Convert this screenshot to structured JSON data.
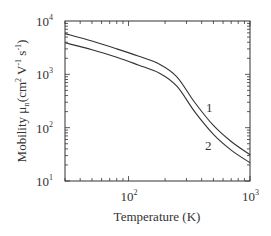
{
  "chart_data": {
    "type": "line",
    "title": "",
    "xlabel": "Temperature (K)",
    "ylabel": "Mobility μn(cm² V⁻¹ s⁻¹)",
    "xscale": "log",
    "yscale": "log",
    "xlim": [
      30,
      1000
    ],
    "ylim": [
      10,
      10000
    ],
    "grid": false,
    "legend_position": "inline labels near curves",
    "x_ticks": [
      {
        "base": "10",
        "exp": "2",
        "value": 100
      },
      {
        "base": "10",
        "exp": "3",
        "value": 1000
      }
    ],
    "y_ticks": [
      {
        "base": "10",
        "exp": "1",
        "value": 10
      },
      {
        "base": "10",
        "exp": "2",
        "value": 100
      },
      {
        "base": "10",
        "exp": "3",
        "value": 1000
      },
      {
        "base": "10",
        "exp": "4",
        "value": 10000
      }
    ],
    "x": [
      30,
      50,
      80,
      120,
      180,
      250,
      350,
      500,
      700,
      1000
    ],
    "series": [
      {
        "name": "1",
        "values": [
          5800,
          4200,
          3000,
          2200,
          1550,
          900,
          300,
          110,
          55,
          31
        ]
      },
      {
        "name": "2",
        "values": [
          3900,
          2900,
          2100,
          1500,
          1050,
          600,
          200,
          75,
          38,
          22
        ]
      }
    ],
    "annotations": [
      {
        "text": "1",
        "near_x": 400,
        "near_y": 150
      },
      {
        "text": "2",
        "near_x": 430,
        "near_y": 70
      }
    ]
  },
  "labels": {
    "xlabel": "Temperature (K)",
    "ylabel_prefix": "Mobility μ",
    "ylabel_sub": "n",
    "ylabel_suffix": "(cm",
    "series1": "1",
    "series2": "2"
  }
}
